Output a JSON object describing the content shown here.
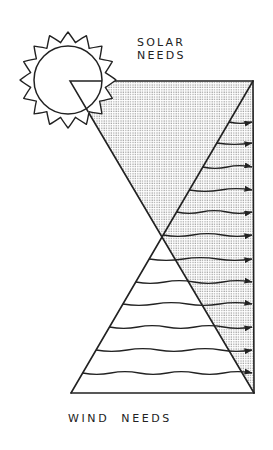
{
  "labels": {
    "solar_line1": "SOLAR",
    "solar_line2": "NEEDS",
    "wind": "WIND  NEEDS"
  },
  "colors": {
    "ink": "#222222",
    "shade_dot": "#9a9a9a",
    "background": "#ffffff"
  },
  "geometry": {
    "top_left": [
      70,
      81
    ],
    "top_right": [
      253,
      81
    ],
    "bottom_left": [
      71,
      393
    ],
    "bottom_right": [
      254,
      393
    ],
    "sun_center": [
      68,
      80
    ],
    "sun_radius": 34,
    "sun_ray_radius": 48,
    "sun_ray_count": 16
  },
  "arrows": {
    "y_positions": [
      122,
      143,
      167,
      190,
      212,
      235,
      259,
      282,
      304,
      327,
      350,
      373
    ],
    "end_x": 252
  }
}
